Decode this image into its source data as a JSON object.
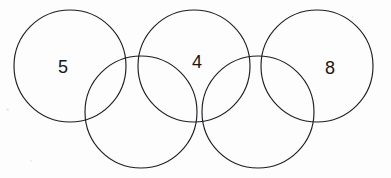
{
  "figure": {
    "kind": "olympic-rings-number-puzzle",
    "background_color": "#fdfdfd",
    "stroke_color": "#1e1e22",
    "text_color": "#17171a",
    "width": 391,
    "height": 178
  },
  "circles": [
    {
      "id": "top-left",
      "name": "circle-top-left",
      "cx": 70,
      "cy": 66,
      "r": 56
    },
    {
      "id": "bottom-left",
      "name": "circle-bottom-left",
      "cx": 141,
      "cy": 112,
      "r": 56
    },
    {
      "id": "top-middle",
      "name": "circle-top-middle",
      "cx": 194,
      "cy": 66,
      "r": 56
    },
    {
      "id": "bottom-right",
      "name": "circle-bottom-right",
      "cx": 258,
      "cy": 112,
      "r": 56
    },
    {
      "id": "top-right",
      "name": "circle-top-right",
      "cx": 317,
      "cy": 66,
      "r": 56
    }
  ],
  "labels": [
    {
      "id": "label-left",
      "text": "5",
      "x": 63,
      "y": 67
    },
    {
      "id": "label-middle",
      "text": "4",
      "x": 197,
      "y": 62
    },
    {
      "id": "label-right",
      "text": "8",
      "x": 330,
      "y": 68
    }
  ],
  "specks": [
    {
      "x": 6,
      "y": 108,
      "w": 3,
      "h": 3
    },
    {
      "x": 352,
      "y": 16,
      "w": 2,
      "h": 2
    },
    {
      "x": 30,
      "y": 160,
      "w": 2,
      "h": 2
    }
  ]
}
